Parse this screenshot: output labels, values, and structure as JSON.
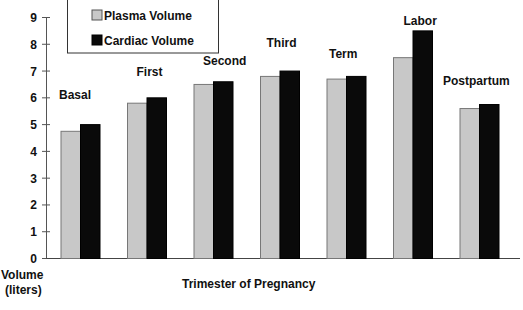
{
  "chart_data": {
    "type": "bar",
    "title": "",
    "xlabel": "Trimester of Pregnancy",
    "ylabel": "Volume (liters)",
    "ylabel_lines": [
      "Volume",
      "(liters)"
    ],
    "ylim": [
      0,
      9
    ],
    "yticks": [
      0,
      1,
      2,
      3,
      4,
      5,
      6,
      7,
      8,
      9
    ],
    "grid": false,
    "legend_position": "top-left (inside)",
    "categories": [
      "Basal",
      "First",
      "Second",
      "Third",
      "Term",
      "Labor",
      "Postpartum"
    ],
    "series": [
      {
        "name": "Plasma Volume",
        "color": "#c8c8c8",
        "values": [
          4.75,
          5.8,
          6.5,
          6.8,
          6.7,
          7.5,
          5.6
        ]
      },
      {
        "name": "Cardiac Volume",
        "color": "#0a0a0a",
        "values": [
          5.0,
          6.0,
          6.6,
          7.0,
          6.8,
          8.5,
          5.75
        ]
      }
    ]
  },
  "legend": {
    "items": [
      {
        "label": "Plasma Volume",
        "color": "#c8c8c8"
      },
      {
        "label": "Cardiac Volume",
        "color": "#0a0a0a"
      }
    ]
  },
  "axes": {
    "x_title": "Trimester of Pregnancy",
    "y_title_line1": "Volume",
    "y_title_line2": "(liters)"
  }
}
